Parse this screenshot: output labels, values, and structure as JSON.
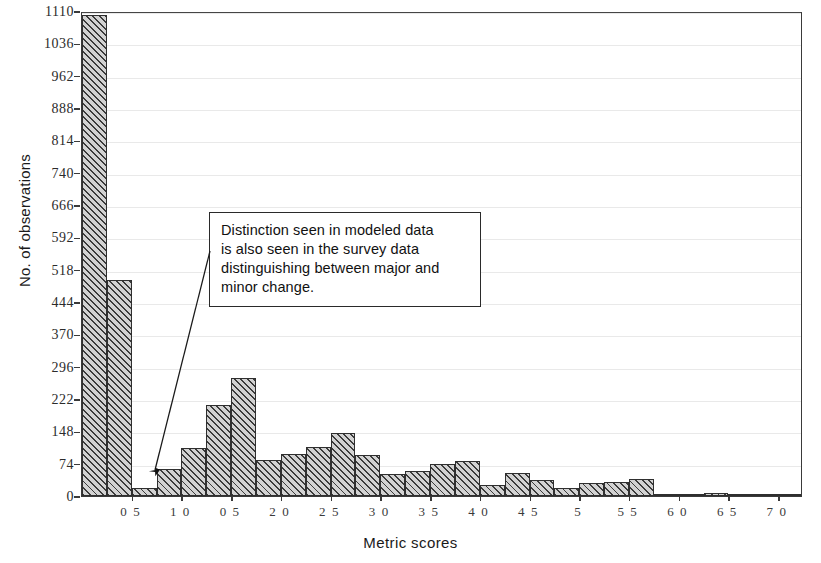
{
  "chart_data": {
    "type": "bar",
    "title": "",
    "xlabel": "Metric scores",
    "ylabel": "No. of observations",
    "xlim": [
      0.0,
      7.25
    ],
    "ylim": [
      0,
      1110
    ],
    "grid": true,
    "legend": null,
    "bin_width": 0.25,
    "x_tick_labels": [
      "0 5",
      "1 0",
      "0 5",
      "2 0",
      "2 5",
      "3 0",
      "3 5",
      "4 0",
      "4 5",
      "5",
      "5 5",
      "6 0",
      "6 5",
      "7 0"
    ],
    "x_tick_values": [
      0.5,
      1.0,
      1.5,
      2.0,
      2.5,
      3.0,
      3.5,
      4.0,
      4.5,
      5.0,
      5.5,
      6.0,
      6.5,
      7.0
    ],
    "y_tick_labels": [
      "1110",
      "1036",
      "962",
      "888",
      "814",
      "740",
      "666",
      "592",
      "518",
      "444",
      "370",
      "296",
      "222",
      "148",
      "74",
      "0"
    ],
    "y_tick_values": [
      1110,
      1036,
      962,
      888,
      814,
      740,
      666,
      592,
      518,
      444,
      370,
      296,
      222,
      148,
      74,
      0
    ],
    "bin_starts": [
      0.0,
      0.25,
      0.5,
      0.75,
      1.0,
      1.25,
      1.5,
      1.75,
      2.0,
      2.25,
      2.5,
      2.75,
      3.0,
      3.25,
      3.5,
      3.75,
      4.0,
      4.25,
      4.5,
      4.75,
      5.0,
      5.25,
      5.5,
      5.75,
      6.0,
      6.25,
      6.5,
      6.75,
      7.0
    ],
    "values": [
      1100,
      495,
      18,
      62,
      110,
      208,
      270,
      82,
      97,
      112,
      145,
      95,
      50,
      57,
      74,
      80,
      26,
      52,
      37,
      18,
      30,
      32,
      40,
      2,
      2,
      8,
      2,
      1,
      1
    ],
    "annotations": [
      {
        "name": "callout",
        "lines": [
          "Distinction seen in modeled data",
          "is also seen in the survey data",
          "distinguishing between major and",
          "minor change."
        ],
        "arrow_points_to_bin": 0.5
      }
    ]
  },
  "figure": {
    "axis_color": "#2f2f2f",
    "bar_fill": "#d2d2d2",
    "bar_hatch": "#3b3b3b",
    "background": "#ffffff"
  }
}
